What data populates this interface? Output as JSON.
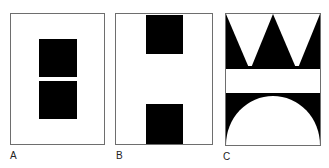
{
  "figure": {
    "panels": [
      {
        "id": "A",
        "label": "A",
        "description": "Two stacked black squares centered in a white frame"
      },
      {
        "id": "B",
        "label": "B",
        "description": "Two black squares at top and bottom edges of a white frame"
      },
      {
        "id": "C",
        "label": "C",
        "description": "Black triangular crown shapes on top, white band in middle, white semicircle on black at bottom"
      }
    ],
    "colors": {
      "fill": "#000000",
      "background": "#ffffff",
      "frame": "#6e6e6e"
    }
  }
}
